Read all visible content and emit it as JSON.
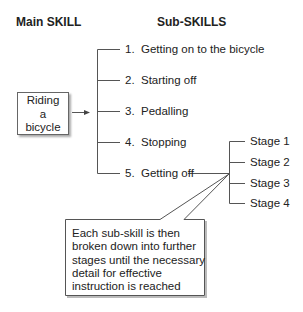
{
  "headers": {
    "main": "Main SKILL",
    "sub": "Sub-SKILLS"
  },
  "main_skill": {
    "lines": [
      "Riding",
      "a",
      "bicycle"
    ]
  },
  "sub_skills": [
    {
      "number": "1.",
      "label": "Getting on to the bicycle"
    },
    {
      "number": "2.",
      "label": "Starting off"
    },
    {
      "number": "3.",
      "label": "Pedalling"
    },
    {
      "number": "4.",
      "label": "Stopping"
    },
    {
      "number": "5.",
      "label": "Getting off"
    }
  ],
  "stages": [
    "Stage 1",
    "Stage 2",
    "Stage 3",
    "Stage 4"
  ],
  "callout": {
    "text": "Each sub-skill is then broken down into further stages until the necessary detail for effective instruction is reached"
  },
  "colors": {
    "line": "#555555",
    "text": "#222222",
    "background": "#ffffff"
  }
}
